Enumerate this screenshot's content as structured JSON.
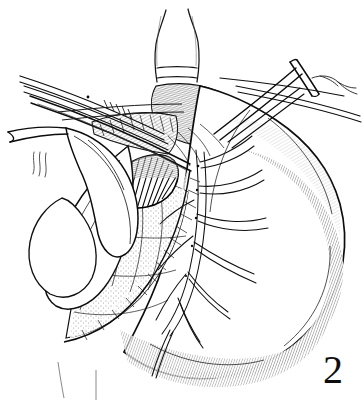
{
  "figure": {
    "number_label": "2",
    "caption": "",
    "style": "pen-and-ink line drawing",
    "medium": "black ink on white background",
    "ink_color": "#111111",
    "background_color": "#ffffff",
    "width_px": 363,
    "height_px": 402
  },
  "subject": {
    "title": "Surgical line illustration of the stomach and esophagogastric junction",
    "domain": "medical-surgical-atlas",
    "view": "anterior operative field view",
    "description": "Operative exposure of the stomach showing the esophagus entering from above, the gastric body and fundus to the right, the lesser curvature with its vascular arcade, retracted liver lobe at the left, and surgical instruments converging on a dissected window at the esophagogastric junction."
  },
  "anatomy": [
    {
      "id": "esophagus",
      "label": "Esophagus",
      "position": "top center",
      "shading": "outline only, two vertical walls narrowing superiorly",
      "bbox": [
        148,
        8,
        56,
        72
      ]
    },
    {
      "id": "esophagogastric-junction",
      "label": "Esophagogastric junction",
      "position": "upper center",
      "shading": "dense cross-hatching, dark",
      "bbox": [
        155,
        80,
        80,
        60
      ]
    },
    {
      "id": "gastric-fundus",
      "label": "Gastric fundus",
      "position": "upper right",
      "shading": "light contour hatching",
      "bbox": [
        225,
        115,
        120,
        90
      ]
    },
    {
      "id": "gastric-body",
      "label": "Gastric body",
      "position": "right",
      "shading": "white field with edge hatching",
      "bbox": [
        200,
        130,
        150,
        200
      ]
    },
    {
      "id": "greater-curvature",
      "label": "Greater curvature",
      "position": "right and lower right border",
      "shading": "dense parallel hatching along margin",
      "bbox": [
        230,
        180,
        120,
        180
      ]
    },
    {
      "id": "lesser-curvature",
      "label": "Lesser curvature",
      "position": "center to lower left",
      "shading": "stippled and dotted texture",
      "bbox": [
        70,
        180,
        140,
        140
      ]
    },
    {
      "id": "gastrohepatic-omentum",
      "label": "Gastrohepatic omentum (lesser omentum)",
      "position": "center left",
      "shading": "fine stipple",
      "bbox": [
        95,
        175,
        110,
        130
      ]
    },
    {
      "id": "left-gastric-vascular-arcade",
      "label": "Left gastric vascular arcade",
      "position": "center right, branching",
      "shading": "paired fine outline branches",
      "bbox": [
        185,
        150,
        110,
        165
      ]
    },
    {
      "id": "liver-left-lobe",
      "label": "Retracted left lobe of liver",
      "position": "left",
      "shading": "clean outline, minimal shading",
      "bbox": [
        22,
        135,
        110,
        120
      ]
    },
    {
      "id": "diaphragmatic-crus",
      "label": "Diaphragmatic crus",
      "position": "upper left of junction",
      "shading": "short parallel hatch strokes",
      "bbox": [
        90,
        115,
        80,
        50
      ]
    },
    {
      "id": "dissected-window",
      "label": "Dissected retroesophageal window",
      "position": "center",
      "shading": "dark with radiating hatch lines",
      "bbox": [
        108,
        150,
        75,
        55
      ]
    },
    {
      "id": "antrum",
      "label": "Gastric antrum",
      "position": "bottom center",
      "shading": "edge hatching",
      "bbox": [
        110,
        300,
        160,
        70
      ]
    }
  ],
  "instruments": [
    {
      "id": "right-clamp",
      "label": "Right-hand dissecting clamp",
      "entry": "upper right",
      "description": "Long slender clamp with ring handle crossbar, tip engaging the junction",
      "bbox": [
        215,
        62,
        145,
        80
      ]
    },
    {
      "id": "suture-tie",
      "label": "Suture ligature with free ends",
      "entry": "upper right, at clamp tip",
      "description": "Thin looped thread with two trailing tails",
      "bbox": [
        295,
        68,
        55,
        30
      ]
    },
    {
      "id": "left-instrument-bundle",
      "label": "Left instrument shafts",
      "entry": "upper left",
      "description": "Three to four parallel slender shafts converging toward the center",
      "bbox": [
        18,
        72,
        180,
        70
      ]
    },
    {
      "id": "liver-retractor",
      "label": "Liver retractor blade",
      "entry": "left",
      "description": "Curved blade with handle, elevating the left hepatic lobe",
      "bbox": [
        20,
        118,
        110,
        130
      ]
    },
    {
      "id": "retractor-handle",
      "label": "Retractor handle shaft",
      "entry": "far left",
      "description": "Straight shaft exiting toward the left image edge",
      "bbox": [
        8,
        126,
        60,
        22
      ]
    },
    {
      "id": "traction-suture-left",
      "label": "Traction suture strands",
      "entry": "left, below retractor",
      "description": "Three short wavy thread strands",
      "bbox": [
        30,
        155,
        30,
        25
      ]
    }
  ],
  "annotations": {
    "leader_lines": [],
    "text_labels": []
  }
}
